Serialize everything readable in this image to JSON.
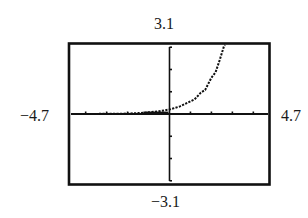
{
  "chart_data": {
    "type": "line",
    "title": "",
    "xlabel": "",
    "ylabel": "",
    "window": {
      "xmin": -4.7,
      "xmax": 4.7,
      "ymin": -3.1,
      "ymax": 3.1
    },
    "labels": {
      "ymax": "3.1",
      "ymin": "−3.1",
      "xmin": "−4.7",
      "xmax": "4.7"
    },
    "xlim": [
      -4.7,
      4.7
    ],
    "ylim": [
      -3.1,
      3.1
    ],
    "x_tick_step": 1,
    "y_tick_step": 1,
    "grid": false,
    "legend": null,
    "series": [
      {
        "name": "curve",
        "style": "dotted",
        "x": [
          -4.7,
          -4.0,
          -3.0,
          -2.0,
          -1.5,
          -1.0,
          -0.5,
          0.0,
          0.5,
          1.0,
          1.2,
          1.5,
          1.7,
          2.0,
          2.2,
          2.4,
          2.6,
          2.65
        ],
        "y": [
          0.0,
          0.0,
          0.01,
          0.02,
          0.04,
          0.07,
          0.12,
          0.2,
          0.34,
          0.57,
          0.66,
          0.96,
          1.08,
          1.63,
          1.88,
          2.44,
          3.05,
          3.1
        ]
      }
    ]
  }
}
